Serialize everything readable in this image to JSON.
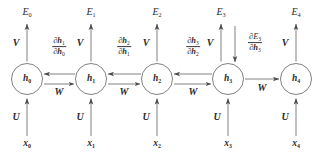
{
  "figure": {
    "type": "diagram",
    "width": 316,
    "height": 155,
    "background_color": "#ffffff",
    "stroke_color": "#555555",
    "text_color": "#2b2b2b"
  },
  "timesteps": [
    {
      "index": 0,
      "cx": 27,
      "output_label": "E",
      "output_sub": "0",
      "hidden_label": "h",
      "hidden_sub": "0",
      "input_label": "x",
      "input_sub": "0",
      "up_weight": "V",
      "in_weight": "U"
    },
    {
      "index": 1,
      "cx": 91,
      "output_label": "E",
      "output_sub": "1",
      "hidden_label": "h",
      "hidden_sub": "1",
      "input_label": "x",
      "input_sub": "1",
      "up_weight": "V",
      "in_weight": "U"
    },
    {
      "index": 2,
      "cx": 157,
      "output_label": "E",
      "output_sub": "2",
      "hidden_label": "h",
      "hidden_sub": "2",
      "input_label": "x",
      "input_sub": "2",
      "up_weight": "V",
      "in_weight": "U"
    },
    {
      "index": 3,
      "cx": 228,
      "output_label": "E",
      "output_sub": "3",
      "hidden_label": "h",
      "hidden_sub": "3",
      "input_label": "x",
      "input_sub": "3",
      "up_weight": "V",
      "in_weight": "U"
    },
    {
      "index": 4,
      "cx": 296,
      "output_label": "E",
      "output_sub": "4",
      "hidden_label": "h",
      "hidden_sub": "4",
      "input_label": "x",
      "input_sub": "4",
      "up_weight": "V",
      "in_weight": "U"
    }
  ],
  "recurrent_links": [
    {
      "from": 0,
      "to": 1,
      "forward_weight": "W",
      "has_backward": true,
      "backward_numer_op": "∂",
      "backward_numer_var": "h",
      "backward_numer_sub": "1",
      "backward_denom_op": "∂",
      "backward_denom_var": "h",
      "backward_denom_sub": "0"
    },
    {
      "from": 1,
      "to": 2,
      "forward_weight": "W",
      "has_backward": true,
      "backward_numer_op": "∂",
      "backward_numer_var": "h",
      "backward_numer_sub": "2",
      "backward_denom_op": "∂",
      "backward_denom_var": "h",
      "backward_denom_sub": "1"
    },
    {
      "from": 2,
      "to": 3,
      "forward_weight": "W",
      "has_backward": true,
      "backward_numer_op": "∂",
      "backward_numer_var": "h",
      "backward_numer_sub": "3",
      "backward_denom_op": "∂",
      "backward_denom_var": "h",
      "backward_denom_sub": "2"
    },
    {
      "from": 3,
      "to": 4,
      "forward_weight": "W",
      "has_backward": false,
      "backward_numer_op": "",
      "backward_numer_var": "",
      "backward_numer_sub": "",
      "backward_denom_op": "",
      "backward_denom_var": "",
      "backward_denom_sub": ""
    }
  ],
  "error_gradient": {
    "at_timestep": 3,
    "numer_op": "∂",
    "numer_var": "E",
    "numer_sub": "3",
    "denom_op": "∂",
    "denom_var": "h",
    "denom_sub": "3",
    "direction": "down"
  }
}
